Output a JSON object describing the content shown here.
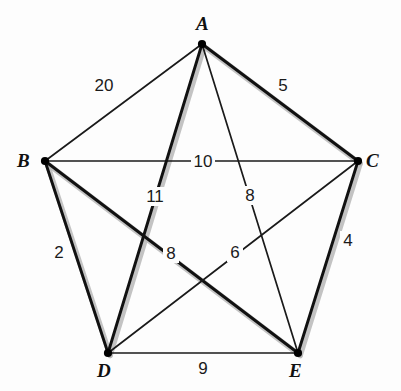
{
  "figure": {
    "background_color": "#fdfdfd",
    "line_color": "#111111",
    "highlight_color": "#b8b8b8"
  },
  "chart_data": {
    "type": "diagram",
    "subtype": "weighted-graph",
    "grid": false,
    "legend": "none",
    "nodes": [
      {
        "id": "A",
        "label": "A",
        "x": 202,
        "y": 44,
        "label_x": 196,
        "label_y": 14
      },
      {
        "id": "B",
        "label": "B",
        "x": 45,
        "y": 161,
        "label_x": 17,
        "label_y": 151
      },
      {
        "id": "C",
        "label": "C",
        "x": 358,
        "y": 161,
        "label_x": 366,
        "label_y": 151
      },
      {
        "id": "D",
        "label": "D",
        "x": 108,
        "y": 353,
        "label_x": 97,
        "label_y": 361
      },
      {
        "id": "E",
        "label": "E",
        "x": 298,
        "y": 353,
        "label_x": 289,
        "label_y": 361
      }
    ],
    "edges": [
      {
        "from": "A",
        "to": "B",
        "weight": 20,
        "highlighted": false,
        "label_x": 104,
        "label_y": 85
      },
      {
        "from": "A",
        "to": "C",
        "weight": 5,
        "highlighted": true,
        "label_x": 283,
        "label_y": 85
      },
      {
        "from": "B",
        "to": "C",
        "weight": 10,
        "highlighted": false,
        "label_x": 203,
        "label_y": 161
      },
      {
        "from": "A",
        "to": "D",
        "weight": 11,
        "highlighted": true,
        "label_x": 155,
        "label_y": 196
      },
      {
        "from": "A",
        "to": "E",
        "weight": 8,
        "highlighted": false,
        "label_x": 250,
        "label_y": 195
      },
      {
        "from": "B",
        "to": "D",
        "weight": 2,
        "highlighted": true,
        "label_x": 59,
        "label_y": 252
      },
      {
        "from": "B",
        "to": "E",
        "weight": 8,
        "highlighted": true,
        "label_x": 171,
        "label_y": 253
      },
      {
        "from": "C",
        "to": "D",
        "weight": 6,
        "highlighted": false,
        "label_x": 235,
        "label_y": 252
      },
      {
        "from": "C",
        "to": "E",
        "weight": 4,
        "highlighted": true,
        "label_x": 348,
        "label_y": 240
      },
      {
        "from": "D",
        "to": "E",
        "weight": 9,
        "highlighted": false,
        "label_x": 203,
        "label_y": 368
      }
    ]
  }
}
